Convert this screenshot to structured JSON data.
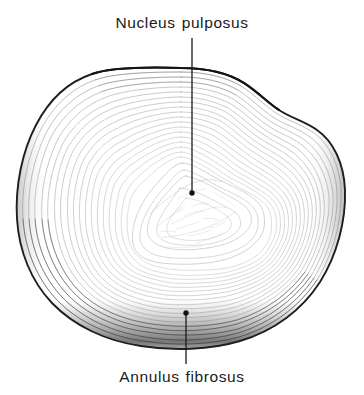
{
  "figure": {
    "background_color": "#ffffff",
    "ink_color": "#1a1a1a",
    "labels": {
      "top": {
        "word1": "Nucleus",
        "word2": "pulposus",
        "full_text": "Nucleus pulposus",
        "leader_line": {
          "x": 192,
          "y_start": 38,
          "y_end": 193,
          "terminal": "dot"
        }
      },
      "bottom": {
        "word1": "Annulus",
        "word2": "fibrosus",
        "full_text": "Annulus fibrosus",
        "leader_line": {
          "x": 186,
          "y_start": 313,
          "y_end": 364,
          "terminal": "dot"
        }
      }
    },
    "structures": [
      {
        "name": "annulus-fibrosus",
        "description": "concentric lamellar rings forming the outer ring of the disc"
      },
      {
        "name": "nucleus-pulposus",
        "description": "central gelatinous core of the disc"
      }
    ],
    "outline": {
      "left_extent": 17,
      "right_extent": 345,
      "top_extent": 68,
      "bottom_extent": 349,
      "shape": "kidney-bean with posterior concavity at top"
    }
  }
}
